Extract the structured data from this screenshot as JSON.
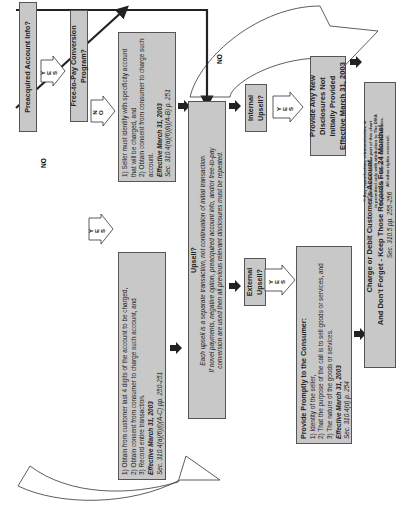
{
  "flowchart": {
    "orientation": "rotated 90 degrees counter-clockwise",
    "nodes": {
      "preacquired": {
        "label": "Preacquired Account Info?"
      },
      "free_to_pay": {
        "label": "Free-to-Pay Conversion Program?"
      },
      "no_branch": {
        "items": [
          "1) Seller must identify with specificity account that will be charged, and",
          "2) Obtain consent from consumer to charge such account."
        ],
        "effective": "Effective March 31, 2003",
        "section": "Sec. 310.4(a)(6)(ii)(A-B) p. 251"
      },
      "yes_branch": {
        "items": [
          "1) Obtain from customer last 4 digits of the account to be charged,",
          "2) Obtain consent from consumer to charge such account, and",
          "3) Record entire transaction."
        ],
        "effective": "Effective March 31, 2003",
        "section": "Sec. 310.4(a)(6)(i)(A-C) pp. 250-251"
      },
      "upsell": {
        "title": "Upsell?",
        "lines": [
          "Each upsell is a separate transaction, not continuation of initial transaction.",
          "If novel payments, negative option, preacquired account info, and/or free-to-pay",
          "conversion are used then all previous relevant disclosures must be repeated."
        ]
      },
      "internal_upsell": {
        "label": "Internal Upsell?"
      },
      "external_upsell": {
        "label": "External Upsell?"
      },
      "new_disclosures": {
        "lines": [
          "Provide Any New",
          "Disclosures Not",
          "Initially Provided",
          "Effective March 31, 2003"
        ]
      },
      "provide_promptly": {
        "title": "Provide Promptly to the Consumer:",
        "items": [
          "1) Identity of the seller,",
          "2) That the purpose of the call is to sell goods or services, and",
          "3) The nature of the goods or services."
        ],
        "effective": "Effective March 31, 2003",
        "section": "Sec. 310.4(d) p. 254"
      },
      "charge": {
        "line1": "Charge or Debit Customer's Account.",
        "line2": "And Don't Forget - Keep Those Records For 24 Months!",
        "section": "Sec. 310.5  pp. 255-256"
      }
    },
    "labels": {
      "yes": [
        "Y",
        "E",
        "S"
      ],
      "no_vertical": [
        "N",
        "O"
      ],
      "no": "NO"
    },
    "copyright": [
      "© Any reproduction, retransmission, or",
      "republication of all or part of this chart",
      "is permitted only with attribution to The DMA",
      "Department of Ethics & Consumer Affairs.",
      "All other rights reserved."
    ],
    "colors": {
      "box_fill": "#c8c8c8",
      "box_border": "#555555",
      "arrow": "#222222",
      "background": "#ffffff"
    }
  }
}
